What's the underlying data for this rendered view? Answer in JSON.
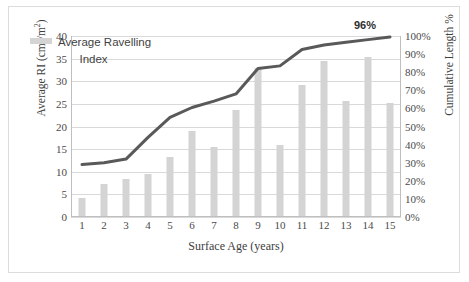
{
  "chart_data": {
    "type": "bar",
    "title": "",
    "xlabel": "Surface Age (years)",
    "ylabel": "Average RI  (cm3/m2)",
    "ylabel_parts": {
      "prefix": "Average RI  (cm",
      "sup1": "3",
      "mid": "/m",
      "sup2": "2",
      "suffix": ")"
    },
    "y2label": "Cumulative Length %",
    "categories": [
      "1",
      "2",
      "3",
      "4",
      "5",
      "6",
      "7",
      "8",
      "9",
      "10",
      "11",
      "12",
      "13",
      "14",
      "15"
    ],
    "ylim": [
      0,
      40
    ],
    "y2lim": [
      0,
      100
    ],
    "yticks": [
      "40",
      "35",
      "30",
      "25",
      "20",
      "15",
      "10",
      "5",
      "0"
    ],
    "ytick_values": [
      40,
      35,
      30,
      25,
      20,
      15,
      10,
      5,
      0
    ],
    "y2ticks": [
      "100%",
      "90%",
      "80%",
      "70%",
      "60%",
      "50%",
      "40%",
      "30%",
      "20%",
      "10%",
      "0%"
    ],
    "y2tick_values": [
      100,
      90,
      80,
      70,
      60,
      50,
      40,
      30,
      20,
      10,
      0
    ],
    "grid": true,
    "legend_position": "upper-left-inside",
    "series": [
      {
        "name": "Average Ravelling Index",
        "type": "bar",
        "axis": "left",
        "color": "#d4d4d4",
        "values": [
          4.0,
          7.0,
          8.1,
          9.3,
          13.0,
          18.8,
          15.2,
          23.4,
          32.8,
          15.7,
          29.0,
          34.2,
          25.4,
          35.2,
          25.0
        ]
      },
      {
        "name": "Cumulative Length %",
        "type": "line",
        "axis": "right",
        "color": "#595959",
        "values": [
          29.0,
          30.0,
          32.0,
          44.0,
          55.0,
          60.5,
          64.0,
          68.0,
          82.0,
          83.5,
          92.5,
          95.0,
          96.5,
          98.0,
          99.5
        ]
      }
    ],
    "annotations": [
      {
        "name": "end-value-label",
        "text": "96%",
        "x": 14,
        "value": 96
      }
    ]
  },
  "legend": {
    "swatch_name": "average-ravelling-index-swatch",
    "line1": "Average Ravelling",
    "line2": "Index"
  }
}
